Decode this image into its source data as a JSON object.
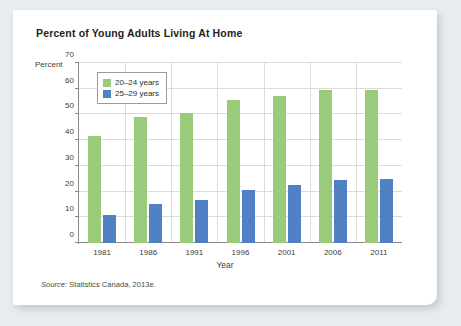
{
  "figure": {
    "title": "Percent of Young Adults Living At Home",
    "y_axis_label": "Percent",
    "x_axis_label": "Year",
    "source_prefix": "Source:",
    "source_text": "Statistics Canada, 2013e."
  },
  "colors": {
    "series_20_24": "#9ACB7B",
    "series_25_29": "#4F81C4",
    "grid": "#dcdcdc",
    "axis": "#8a8a8a",
    "page_background": "#e9ecee",
    "card_background": "#ffffff",
    "title_text": "#231f20"
  },
  "chart_data": {
    "type": "bar",
    "title": "Percent of Young Adults Living At Home",
    "xlabel": "Year",
    "ylabel": "Percent",
    "categories": [
      "1981",
      "1986",
      "1991",
      "1996",
      "2001",
      "2006",
      "2011"
    ],
    "series": [
      {
        "name": "20–24 years",
        "color": "#9ACB7B",
        "values": [
          41.5,
          49.0,
          50.5,
          55.8,
          57.3,
          59.5,
          59.5
        ]
      },
      {
        "name": "25–29 years",
        "color": "#4F81C4",
        "values": [
          11.0,
          15.0,
          16.7,
          20.7,
          22.5,
          24.5,
          25.0
        ]
      }
    ],
    "ylim": [
      0,
      70
    ],
    "yticks": [
      0,
      10,
      20,
      30,
      40,
      50,
      60,
      70
    ],
    "ytick_labels": [
      "0",
      "10",
      "20",
      "30",
      "40",
      "50",
      "60",
      "70"
    ],
    "grid": true,
    "legend_position": "upper left",
    "legend_entries": [
      "20–24 years",
      "25–29 years"
    ]
  }
}
